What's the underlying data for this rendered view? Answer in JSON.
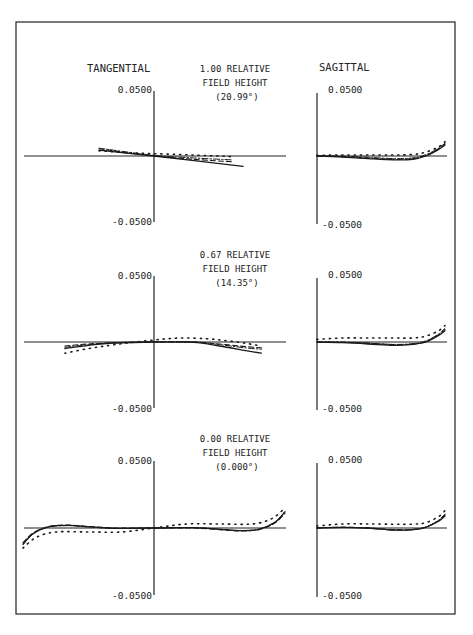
{
  "chart_data": {
    "type": "line",
    "column_titles": {
      "tangential": "TANGENTIAL",
      "sagittal": "SAGITTAL"
    },
    "ylim": [
      -0.05,
      0.05
    ],
    "xlim": [
      -1,
      1
    ],
    "tick_labels": {
      "top": "0.0500",
      "bottom": "-0.0500"
    },
    "grid": false,
    "legend": "none",
    "series_styles": [
      "solid",
      "dash",
      "dot",
      "dashdot"
    ],
    "panels": [
      {
        "field_label": [
          "1.00 RELATIVE",
          "FIELD HEIGHT",
          "(20.99°)"
        ],
        "tangential": {
          "x_range": [
            -0.42,
            0.68
          ],
          "series": [
            {
              "name": "solid",
              "x": [
                -0.42,
                0,
                0.68
              ],
              "y": [
                0.0045,
                0,
                -0.008
              ]
            },
            {
              "name": "dash",
              "x": [
                -0.42,
                -0.2,
                0,
                0.3,
                0.6
              ],
              "y": [
                0.0055,
                0.0025,
                0,
                -0.0025,
                -0.0045
              ]
            },
            {
              "name": "dot",
              "x": [
                -0.42,
                -0.2,
                0,
                0.3,
                0.6
              ],
              "y": [
                0.004,
                0.0025,
                0.0018,
                0.0008,
                -0.0005
              ]
            },
            {
              "name": "dashdot",
              "x": [
                -0.42,
                -0.2,
                0,
                0.3,
                0.6
              ],
              "y": [
                0.006,
                0.003,
                0.0005,
                -0.0015,
                -0.003
              ]
            }
          ]
        },
        "sagittal": {
          "x_range": [
            0,
            1
          ],
          "series": [
            {
              "name": "solid",
              "x": [
                0,
                0.2,
                0.4,
                0.6,
                0.75,
                0.85,
                0.95,
                1.0
              ],
              "y": [
                0,
                -0.0008,
                -0.002,
                -0.003,
                -0.0025,
                0,
                0.005,
                0.0085
              ]
            },
            {
              "name": "dash",
              "x": [
                0,
                0.2,
                0.4,
                0.6,
                0.75,
                0.85,
                0.95,
                1.0
              ],
              "y": [
                0,
                -0.0005,
                -0.0015,
                -0.0025,
                -0.002,
                0.0002,
                0.0055,
                0.0095
              ]
            },
            {
              "name": "dot",
              "x": [
                0,
                0.2,
                0.4,
                0.6,
                0.75,
                0.85,
                0.95,
                1.0
              ],
              "y": [
                0.0005,
                0.0008,
                0.0008,
                0.0008,
                0.0012,
                0.003,
                0.007,
                0.011
              ]
            },
            {
              "name": "dashdot",
              "x": [
                0,
                0.2,
                0.4,
                0.6,
                0.75,
                0.85,
                0.95,
                1.0
              ],
              "y": [
                0.0002,
                0,
                -0.001,
                -0.002,
                -0.0015,
                0.001,
                0.006,
                0.01
              ]
            }
          ]
        }
      },
      {
        "field_label": [
          "0.67 RELATIVE",
          "FIELD HEIGHT",
          "(14.35°)"
        ],
        "tangential": {
          "x_range": [
            -0.68,
            0.82
          ],
          "series": [
            {
              "name": "solid",
              "x": [
                -0.68,
                -0.5,
                -0.3,
                0,
                0.3,
                0.5,
                0.7,
                0.82
              ],
              "y": [
                -0.005,
                -0.0025,
                -0.0008,
                0,
                -0.0002,
                -0.003,
                -0.0065,
                -0.0085
              ]
            },
            {
              "name": "dash",
              "x": [
                -0.68,
                -0.5,
                -0.3,
                0,
                0.3,
                0.5,
                0.7,
                0.82
              ],
              "y": [
                -0.003,
                -0.0015,
                -0.0005,
                0,
                0,
                -0.0015,
                -0.0035,
                -0.0045
              ]
            },
            {
              "name": "dot",
              "x": [
                -0.68,
                -0.5,
                -0.3,
                0,
                0.2,
                0.4,
                0.55,
                0.7,
                0.82
              ],
              "y": [
                -0.0085,
                -0.005,
                -0.002,
                0.0015,
                0.003,
                0.0025,
                0.001,
                -0.001,
                -0.003
              ]
            },
            {
              "name": "dashdot",
              "x": [
                -0.68,
                -0.5,
                -0.3,
                0,
                0.3,
                0.5,
                0.7,
                0.82
              ],
              "y": [
                -0.004,
                -0.002,
                -0.0005,
                0,
                0,
                -0.002,
                -0.0045,
                -0.0055
              ]
            }
          ]
        },
        "sagittal": {
          "x_range": [
            0,
            1
          ],
          "series": [
            {
              "name": "solid",
              "x": [
                0,
                0.2,
                0.4,
                0.6,
                0.75,
                0.85,
                0.95,
                1.0
              ],
              "y": [
                0,
                -0.0005,
                -0.0015,
                -0.0025,
                -0.0018,
                0,
                0.005,
                0.0085
              ]
            },
            {
              "name": "dash",
              "x": [
                0,
                0.2,
                0.4,
                0.6,
                0.75,
                0.85,
                0.95,
                1.0
              ],
              "y": [
                0,
                -0.0003,
                -0.001,
                -0.002,
                -0.0015,
                0.0003,
                0.0055,
                0.0095
              ]
            },
            {
              "name": "dot",
              "x": [
                0,
                0.2,
                0.4,
                0.6,
                0.75,
                0.85,
                0.95,
                1.0
              ],
              "y": [
                0.002,
                0.003,
                0.003,
                0.003,
                0.003,
                0.0045,
                0.0085,
                0.0125
              ]
            },
            {
              "name": "dashdot",
              "x": [
                0,
                0.2,
                0.4,
                0.6,
                0.75,
                0.85,
                0.95,
                1.0
              ],
              "y": [
                0.0002,
                0,
                -0.0008,
                -0.0018,
                -0.0012,
                0.0008,
                0.006,
                0.0105
              ]
            }
          ]
        }
      },
      {
        "field_label": [
          "0.00 RELATIVE",
          "FIELD HEIGHT",
          "(0.000°)"
        ],
        "tangential": {
          "x_range": [
            -1,
            1
          ],
          "series": [
            {
              "name": "solid",
              "x": [
                -1,
                -0.92,
                -0.8,
                -0.65,
                -0.5,
                -0.3,
                0,
                0.3,
                0.5,
                0.65,
                0.8,
                0.92,
                1.0
              ],
              "y": [
                -0.012,
                -0.004,
                0.001,
                0.002,
                0.001,
                -0.0002,
                0,
                0.0002,
                -0.001,
                -0.002,
                -0.001,
                0.004,
                0.012
              ]
            },
            {
              "name": "dash",
              "x": [
                -1,
                -0.92,
                -0.8,
                -0.65,
                -0.5,
                -0.3,
                0,
                0.3,
                0.5,
                0.65,
                0.8,
                0.92,
                1.0
              ],
              "y": [
                -0.011,
                -0.0035,
                0.0012,
                0.0022,
                0.0012,
                0,
                0,
                0,
                -0.0012,
                -0.0022,
                -0.0012,
                0.0035,
                0.011
              ]
            },
            {
              "name": "dot",
              "x": [
                -1,
                -0.9,
                -0.75,
                -0.5,
                -0.25,
                0,
                0.25,
                0.5,
                0.75,
                0.9,
                1.0
              ],
              "y": [
                -0.015,
                -0.007,
                -0.003,
                -0.003,
                -0.003,
                0,
                0.003,
                0.003,
                0.003,
                0.007,
                0.015
              ]
            },
            {
              "name": "dashdot",
              "x": [
                -1,
                -0.92,
                -0.8,
                -0.65,
                -0.5,
                -0.3,
                0,
                0.3,
                0.5,
                0.65,
                0.8,
                0.92,
                1.0
              ],
              "y": [
                -0.0125,
                -0.0042,
                0.0008,
                0.0018,
                0.0008,
                -0.0003,
                0,
                0.0003,
                -0.0008,
                -0.0018,
                -0.0008,
                0.0042,
                0.0125
              ]
            }
          ]
        },
        "sagittal": {
          "x_range": [
            0,
            1
          ],
          "series": [
            {
              "name": "solid",
              "x": [
                0,
                0.2,
                0.4,
                0.6,
                0.75,
                0.85,
                0.95,
                1.0
              ],
              "y": [
                0,
                0.0005,
                0,
                -0.0015,
                -0.0012,
                0.0005,
                0.005,
                0.009
              ]
            },
            {
              "name": "dash",
              "x": [
                0,
                0.2,
                0.4,
                0.6,
                0.75,
                0.85,
                0.95,
                1.0
              ],
              "y": [
                0,
                0.0006,
                0.0001,
                -0.0012,
                -0.001,
                0.0008,
                0.0055,
                0.01
              ]
            },
            {
              "name": "dot",
              "x": [
                0,
                0.2,
                0.4,
                0.6,
                0.75,
                0.85,
                0.95,
                1.0
              ],
              "y": [
                0.0015,
                0.003,
                0.003,
                0.0028,
                0.0028,
                0.004,
                0.0085,
                0.013
              ]
            },
            {
              "name": "dashdot",
              "x": [
                0,
                0.2,
                0.4,
                0.6,
                0.75,
                0.85,
                0.95,
                1.0
              ],
              "y": [
                0.0002,
                0.0005,
                -0.0002,
                -0.0016,
                -0.0013,
                0.0006,
                0.0058,
                0.0105
              ]
            }
          ]
        }
      }
    ]
  }
}
